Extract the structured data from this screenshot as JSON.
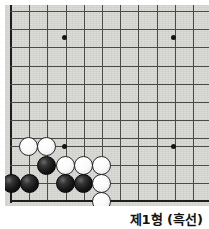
{
  "figure": {
    "kind": "go-board-diagram",
    "width": 209,
    "height": 229
  },
  "board": {
    "label": "Go board bottom-left corner",
    "background_color": "#d9d9d6",
    "line_color": "#4a4a4a",
    "edge_color": "#1e1e1e",
    "columns_visible": 11,
    "rows_visible": 11,
    "cell_size": 18.2,
    "origin_x": 11,
    "origin_y": 11,
    "vertical_lines_x": [
      11,
      29.2,
      47.4,
      65.6,
      83.8,
      102,
      120.2,
      138.4,
      156.6,
      174.8,
      193
    ],
    "horizontal_lines_y": [
      11,
      29.2,
      47.4,
      65.6,
      83.8,
      102,
      120.2,
      138.4,
      146,
      164.5,
      183,
      201
    ],
    "star_points": [
      {
        "x": 64,
        "y": 37,
        "name": "star-point-top-left"
      },
      {
        "x": 173,
        "y": 37,
        "name": "star-point-top-right"
      },
      {
        "x": 64,
        "y": 146,
        "name": "star-point-bottom-left"
      },
      {
        "x": 173,
        "y": 146,
        "name": "star-point-bottom-right"
      }
    ],
    "edges": {
      "left_x": 11,
      "bottom_y": 201
    }
  },
  "stones": [
    {
      "id": "w1",
      "color": "white",
      "x": 28,
      "y": 146
    },
    {
      "id": "w2",
      "color": "white",
      "x": 46,
      "y": 146
    },
    {
      "id": "b1",
      "color": "black",
      "x": 46,
      "y": 165
    },
    {
      "id": "w3",
      "color": "white",
      "x": 65,
      "y": 165
    },
    {
      "id": "w4",
      "color": "white",
      "x": 83,
      "y": 165
    },
    {
      "id": "w5",
      "color": "white",
      "x": 101,
      "y": 165
    },
    {
      "id": "b2",
      "color": "black",
      "x": 11,
      "y": 183
    },
    {
      "id": "b3",
      "color": "black",
      "x": 29,
      "y": 183
    },
    {
      "id": "b4",
      "color": "black",
      "x": 65,
      "y": 183
    },
    {
      "id": "b5",
      "color": "black",
      "x": 83,
      "y": 183
    },
    {
      "id": "w6",
      "color": "white",
      "x": 101,
      "y": 183
    },
    {
      "id": "w7",
      "color": "white",
      "x": 101,
      "y": 201
    }
  ],
  "caption": {
    "text": "제1형 (흑선)"
  },
  "colors": {
    "board": "#d9d9d6",
    "grid_line": "#4a4a4a",
    "board_edge": "#1e1e1e",
    "black_stone": "#141414",
    "white_stone": "#fbfbfb",
    "caption_text": "#111111",
    "page_background": "#ffffff"
  }
}
